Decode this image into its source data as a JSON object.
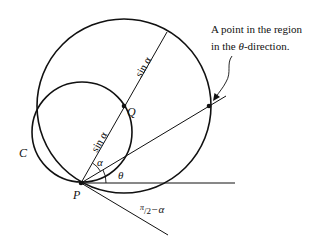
{
  "diagram": {
    "annotation_line1": "A point in the region",
    "annotation_line2_prefix": "in the ",
    "annotation_theta": "θ",
    "annotation_line2_suffix": "-direction.",
    "label_C": "C",
    "label_P": "P",
    "label_Q": "Q",
    "label_alpha": "α",
    "label_theta": "θ",
    "label_sin_alpha_upper": "sin α",
    "label_sin_alpha_lower": "sin α",
    "label_pi": "π",
    "label_slash2": "/2",
    "label_minus_alpha": "−α"
  },
  "colors": {
    "stroke": "#111111",
    "background": "#ffffff"
  }
}
